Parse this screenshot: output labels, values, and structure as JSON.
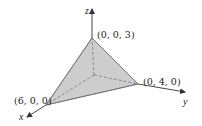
{
  "diagram": {
    "type": "3d-coordinate-tetrahedron",
    "axes": {
      "x": {
        "label": "x"
      },
      "y": {
        "label": "y"
      },
      "z": {
        "label": "z"
      }
    },
    "vertices": [
      {
        "name": "x-intercept",
        "label": "(6, 0, 0)"
      },
      {
        "name": "y-intercept",
        "label": "(0, 4, 0)"
      },
      {
        "name": "z-intercept",
        "label": "(0, 0, 3)"
      }
    ],
    "colors": {
      "face_fill": "#c8c8c8",
      "line": "#333333",
      "hidden_line": "#777777",
      "background": "#ffffff"
    }
  }
}
